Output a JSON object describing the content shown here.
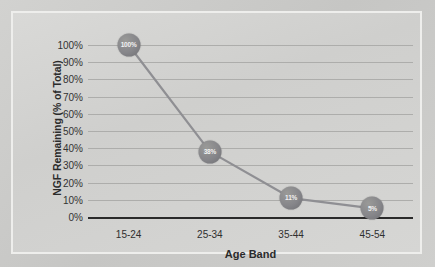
{
  "chart_data": {
    "type": "line",
    "title": "",
    "xlabel": "Age Band",
    "ylabel": "NGF Remaining (% of Total)",
    "categories": [
      "15-24",
      "25-34",
      "35-44",
      "45-54"
    ],
    "values": [
      100,
      38,
      11,
      5
    ],
    "point_labels": [
      "100%",
      "38%",
      "11%",
      "5%"
    ],
    "ylim": [
      0,
      100
    ],
    "ytick_labels": [
      "100%",
      "90%",
      "80%",
      "70%",
      "60%",
      "50%",
      "40%",
      "30%",
      "20%",
      "10%",
      "0%"
    ],
    "ytick_values": [
      100,
      90,
      80,
      70,
      60,
      50,
      40,
      30,
      20,
      10,
      0
    ],
    "grid": true,
    "legend": false,
    "colors": {
      "line": "#8f8f93",
      "marker": "#7d7d81",
      "marker_label": "#f2f2f2",
      "gridline": "#adadab",
      "baseline": "#2a2a2a",
      "plot_background": "#d6d6d4",
      "page_background": "#c9c9c7",
      "frame_border": "#eeeeec",
      "axis_text": "#2b2b2b"
    }
  }
}
